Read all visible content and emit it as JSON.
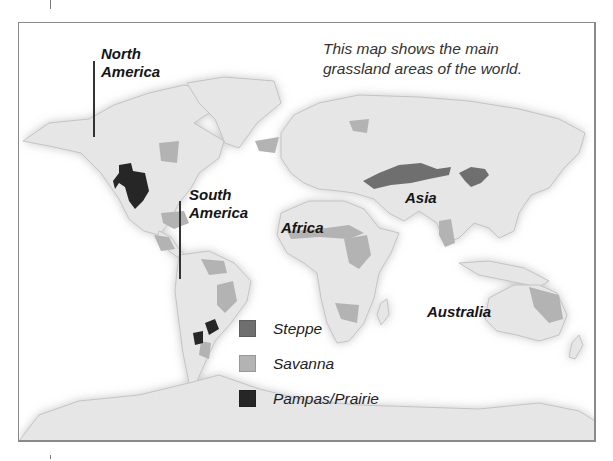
{
  "map": {
    "caption": "This map shows the main grassland areas of the world.",
    "caption_line1": "This map shows the main",
    "caption_line2": "grassland areas of the world.",
    "colors": {
      "ocean": "#ffffff",
      "land": "#e6e6e6",
      "land_edge": "#c4c4c4",
      "steppe": "#6f6f6f",
      "savanna": "#b3b3b3",
      "pampas_prairie": "#262626",
      "frame": "#8a8a8a"
    },
    "region_labels": [
      {
        "id": "north-america",
        "line1": "North",
        "line2": "America"
      },
      {
        "id": "south-america",
        "line1": "South",
        "line2": "America"
      },
      {
        "id": "africa",
        "line1": "Africa"
      },
      {
        "id": "asia",
        "line1": "Asia"
      },
      {
        "id": "australia",
        "line1": "Australia"
      }
    ],
    "legend": [
      {
        "label": "Steppe",
        "color": "#6f6f6f",
        "icon": "steppe-swatch"
      },
      {
        "label": "Savanna",
        "color": "#b3b3b3",
        "icon": "savanna-swatch"
      },
      {
        "label": "Pampas/Prairie",
        "color": "#262626",
        "icon": "pampas-prairie-swatch"
      }
    ]
  }
}
